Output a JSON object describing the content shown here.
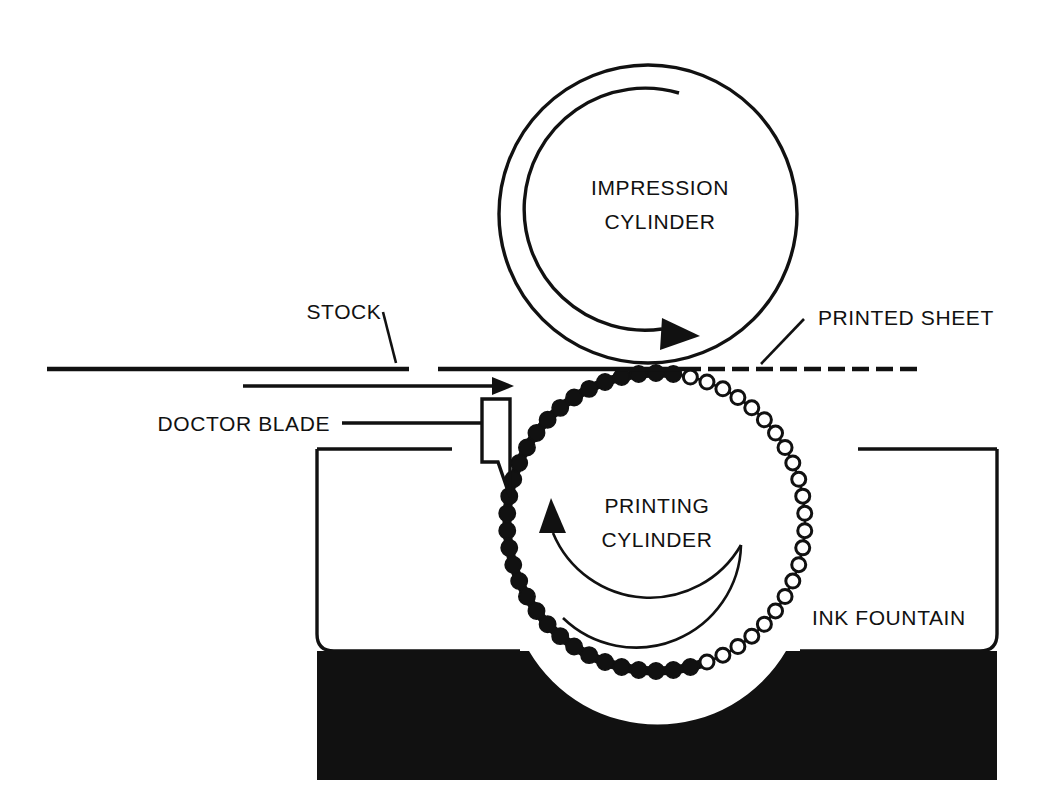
{
  "diagram": {
    "background_color": "#ffffff",
    "line_color": "#111111",
    "ink_color": "#111111",
    "labels": {
      "impression_cylinder_line1": "IMPRESSION",
      "impression_cylinder_line2": "CYLINDER",
      "printing_cylinder_line1": "PRINTING",
      "printing_cylinder_line2": "CYLINDER",
      "stock": "STOCK",
      "printed_sheet": "PRINTED SHEET",
      "doctor_blade": "DOCTOR BLADE",
      "ink_fountain": "INK FOUNTAIN"
    },
    "parts": [
      {
        "name": "impression-cylinder",
        "label": "IMPRESSION CYLINDER",
        "shape": "circle",
        "center_x": 648,
        "center_y": 214,
        "radius": 149,
        "rotation": "clockwise",
        "rotation_arrow": "clockwise-arc-arrow"
      },
      {
        "name": "printing-cylinder",
        "label": "PRINTING CYLINDER",
        "shape": "circle-engraved",
        "center_x": 656,
        "center_y": 522,
        "radius": 149,
        "rotation": "counter-clockwise",
        "rotation_arrow": "counter-clockwise-arc-arrow",
        "surface": "engraved-cells"
      },
      {
        "name": "stock",
        "label": "STOCK",
        "shape": "horizontal-line",
        "x_start": 47,
        "x_end": 409,
        "y": 369
      },
      {
        "name": "printed-sheet",
        "label": "PRINTED SHEET",
        "shape": "dashed-horizontal-line",
        "x_start": 438,
        "x_end": 921,
        "y": 369
      },
      {
        "name": "feed-direction-arrow",
        "label": "",
        "shape": "arrow-right",
        "x_start": 243,
        "x_end": 512,
        "y": 386
      },
      {
        "name": "doctor-blade",
        "label": "DOCTOR BLADE",
        "shape": "tapered-blade",
        "x": 482,
        "y_top": 399,
        "y_tip": 497,
        "width": 28
      },
      {
        "name": "ink-fountain",
        "label": "INK FOUNTAIN",
        "shape": "rounded-trough",
        "x_left": 317,
        "x_right": 997,
        "y_top": 449,
        "y_bottom": 780,
        "ink_level_y": 651
      }
    ]
  }
}
